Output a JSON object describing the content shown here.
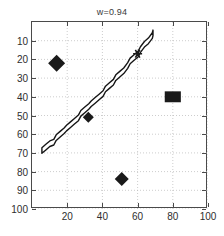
{
  "chart_data": {
    "type": "scatter",
    "title": "w=0.94",
    "xlabel": "",
    "ylabel": "",
    "xlim": [
      0,
      100
    ],
    "ylim": [
      0,
      100
    ],
    "y_axis_inverted": true,
    "grid": true,
    "grid_style": "dotted",
    "legend": null,
    "xticks": [
      20,
      40,
      60,
      80,
      100
    ],
    "yticks": [
      10,
      20,
      30,
      40,
      50,
      60,
      70,
      80,
      90,
      100
    ],
    "xtick_labels": [
      "20",
      "40",
      "60",
      "80",
      "100"
    ],
    "ytick_labels": [
      "10",
      "20",
      "30",
      "40",
      "50",
      "60",
      "70",
      "80",
      "90",
      "100"
    ],
    "series": [
      {
        "name": "markers",
        "marker": "diamond",
        "color": "#1a1a1a",
        "points": [
          {
            "x": 14,
            "y": 22,
            "marker": "diamond",
            "size": 17
          },
          {
            "x": 32,
            "y": 51,
            "marker": "diamond",
            "size": 11
          },
          {
            "x": 51,
            "y": 84,
            "marker": "diamond",
            "size": 14
          },
          {
            "x": 80,
            "y": 40,
            "marker": "square",
            "size": 14
          },
          {
            "x": 60,
            "y": 17,
            "marker": "star",
            "size": 9
          }
        ]
      },
      {
        "name": "band",
        "marker": "none",
        "type": "band",
        "color": "#1a1a1a",
        "fill": "#ffffff",
        "x": [
          6,
          8,
          10,
          12,
          14,
          16,
          18,
          20,
          22,
          24,
          26,
          28,
          30,
          32,
          34,
          36,
          38,
          40,
          42,
          44,
          46,
          48,
          50,
          52,
          54,
          56,
          58,
          60,
          62,
          64,
          66,
          68,
          69
        ],
        "y": [
          69,
          67,
          65,
          64,
          62,
          60,
          58,
          57,
          55,
          53,
          51,
          49,
          47,
          45,
          44,
          42,
          40,
          38,
          36,
          34,
          32,
          30,
          28,
          26,
          23,
          21,
          19,
          17,
          15,
          12,
          10,
          7,
          6
        ],
        "band_width": 3.0
      }
    ]
  }
}
